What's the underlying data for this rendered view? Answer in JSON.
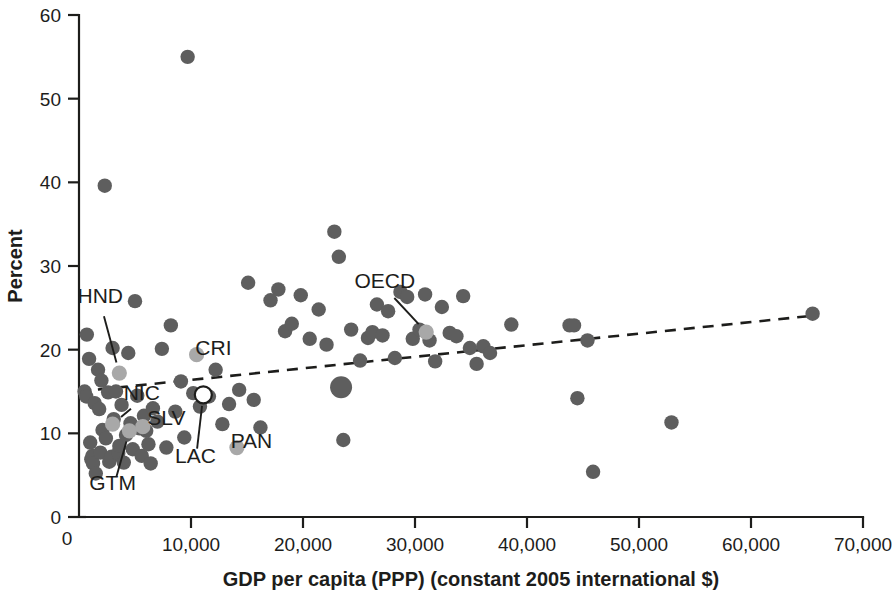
{
  "chart_data": {
    "type": "scatter",
    "title": "",
    "xlabel": "GDP per capita (PPP) (constant 2005 international $)",
    "ylabel": "Percent",
    "xlim": [
      0,
      70000
    ],
    "ylim": [
      0,
      60
    ],
    "xticks": [
      0,
      10000,
      20000,
      30000,
      40000,
      50000,
      60000,
      70000
    ],
    "xtick_labels": [
      "0",
      "10,000",
      "20,000",
      "30,000",
      "40,000",
      "50,000",
      "60,000",
      "70,000"
    ],
    "yticks": [
      0,
      10,
      20,
      30,
      40,
      50,
      60
    ],
    "ytick_labels": [
      "0",
      "10",
      "20",
      "30",
      "40",
      "50",
      "60"
    ],
    "grid": false,
    "legend": "none",
    "marker_color": "#5e5e5e",
    "highlight_color": "#a8a8a8",
    "trendline_color": "#1d1d1b",
    "series": [
      {
        "name": "countries",
        "marker": "filled-circle",
        "points": [
          [
            500,
            15.0
          ],
          [
            650,
            14.4
          ],
          [
            700,
            21.8
          ],
          [
            900,
            18.9
          ],
          [
            1000,
            8.9
          ],
          [
            1100,
            6.9
          ],
          [
            1200,
            7.3
          ],
          [
            1250,
            6.4
          ],
          [
            1400,
            13.6
          ],
          [
            1500,
            5.2
          ],
          [
            1700,
            17.6
          ],
          [
            1800,
            12.9
          ],
          [
            1900,
            7.7
          ],
          [
            2000,
            16.3
          ],
          [
            2100,
            10.4
          ],
          [
            2300,
            39.6
          ],
          [
            2400,
            9.4
          ],
          [
            2600,
            14.9
          ],
          [
            2700,
            6.6
          ],
          [
            2900,
            7.2
          ],
          [
            3000,
            20.2
          ],
          [
            3100,
            11.7
          ],
          [
            3300,
            15.0
          ],
          [
            3500,
            7.6
          ],
          [
            3600,
            8.5
          ],
          [
            3800,
            13.4
          ],
          [
            4000,
            6.5
          ],
          [
            4200,
            9.8
          ],
          [
            4400,
            19.6
          ],
          [
            4600,
            11.2
          ],
          [
            4800,
            8.1
          ],
          [
            5000,
            25.8
          ],
          [
            5200,
            14.5
          ],
          [
            5400,
            10.6
          ],
          [
            5600,
            7.3
          ],
          [
            5800,
            12.1
          ],
          [
            6000,
            10.3
          ],
          [
            6200,
            8.7
          ],
          [
            6400,
            6.4
          ],
          [
            6600,
            13.0
          ],
          [
            7000,
            11.4
          ],
          [
            7400,
            20.1
          ],
          [
            7800,
            8.3
          ],
          [
            8200,
            22.9
          ],
          [
            8600,
            12.6
          ],
          [
            9100,
            16.2
          ],
          [
            9400,
            9.5
          ],
          [
            9700,
            55.0
          ],
          [
            10200,
            14.8
          ],
          [
            10800,
            13.2
          ],
          [
            11600,
            14.4
          ],
          [
            12200,
            17.6
          ],
          [
            12800,
            11.1
          ],
          [
            13400,
            13.5
          ],
          [
            14300,
            15.2
          ],
          [
            15100,
            28.0
          ],
          [
            15600,
            14.0
          ],
          [
            16200,
            10.7
          ],
          [
            17100,
            25.9
          ],
          [
            17800,
            27.2
          ],
          [
            18400,
            22.2
          ],
          [
            19000,
            23.1
          ],
          [
            19800,
            26.5
          ],
          [
            20600,
            21.3
          ],
          [
            21400,
            24.8
          ],
          [
            22100,
            20.6
          ],
          [
            22800,
            34.1
          ],
          [
            23200,
            31.1
          ],
          [
            23400,
            15.5
          ],
          [
            23600,
            9.2
          ],
          [
            24300,
            22.4
          ],
          [
            25100,
            18.7
          ],
          [
            25800,
            21.4
          ],
          [
            26200,
            22.1
          ],
          [
            26600,
            25.4
          ],
          [
            27100,
            21.7
          ],
          [
            27600,
            24.6
          ],
          [
            28200,
            19.0
          ],
          [
            28700,
            26.9
          ],
          [
            29300,
            26.3
          ],
          [
            29800,
            21.3
          ],
          [
            30400,
            22.4
          ],
          [
            30900,
            26.6
          ],
          [
            31300,
            21.1
          ],
          [
            31800,
            18.6
          ],
          [
            32400,
            25.1
          ],
          [
            33100,
            22.0
          ],
          [
            33700,
            21.6
          ],
          [
            34300,
            26.4
          ],
          [
            34900,
            20.2
          ],
          [
            35500,
            18.3
          ],
          [
            36100,
            20.4
          ],
          [
            36700,
            19.6
          ],
          [
            38600,
            23.0
          ],
          [
            43800,
            22.9
          ],
          [
            44200,
            22.9
          ],
          [
            44500,
            14.2
          ],
          [
            45400,
            21.1
          ],
          [
            45900,
            5.4
          ],
          [
            52900,
            11.3
          ],
          [
            65500,
            24.3
          ]
        ]
      },
      {
        "name": "large-marker",
        "marker": "filled-circle-large",
        "points": [
          [
            23400,
            15.5
          ]
        ]
      }
    ],
    "highlighted_points": [
      {
        "code": "HND",
        "x": 3600,
        "y": 17.2,
        "marker": "filled-circle-light"
      },
      {
        "code": "NIC",
        "x": 3000,
        "y": 11.1,
        "marker": "filled-circle-light"
      },
      {
        "code": "GTM",
        "x": 4500,
        "y": 10.3,
        "marker": "filled-circle-light"
      },
      {
        "code": "SLV",
        "x": 5700,
        "y": 10.8,
        "marker": "filled-circle-light"
      },
      {
        "code": "CRI",
        "x": 10500,
        "y": 19.4,
        "marker": "filled-circle-light"
      },
      {
        "code": "PAN",
        "x": 14100,
        "y": 8.3,
        "marker": "filled-circle-light"
      },
      {
        "code": "OECD",
        "x": 31000,
        "y": 22.1,
        "marker": "filled-circle-light"
      },
      {
        "code": "LAC",
        "x": 11100,
        "y": 14.6,
        "marker": "open-circle"
      }
    ],
    "trendline": {
      "type": "dashed-linear",
      "x_start": 0,
      "y_start": 15.0,
      "x_end": 65800,
      "y_end": 24.1
    },
    "annotations": [
      {
        "label": "HND",
        "label_x": 1900,
        "label_y": 25.6,
        "point_x": 3600,
        "point_y": 17.2
      },
      {
        "label": "NIC",
        "label_x": 5600,
        "label_y": 14.0,
        "point_x": 3000,
        "point_y": 11.1
      },
      {
        "label": "GTM",
        "label_x": 3000,
        "label_y": 3.2,
        "point_x": 4500,
        "point_y": 10.3
      },
      {
        "label": "SLV",
        "label_x": 7800,
        "label_y": 11.0,
        "point_x": null,
        "point_y": null
      },
      {
        "label": "CRI",
        "label_x": 12000,
        "label_y": 19.4,
        "point_x": null,
        "point_y": null
      },
      {
        "label": "LAC",
        "label_x": 10400,
        "label_y": 6.5,
        "point_x": 11100,
        "point_y": 14.6
      },
      {
        "label": "PAN",
        "label_x": 15400,
        "label_y": 8.3,
        "point_x": null,
        "point_y": null
      },
      {
        "label": "OECD",
        "label_x": 27300,
        "label_y": 27.4,
        "point_x": 31000,
        "point_y": 22.1
      }
    ]
  }
}
